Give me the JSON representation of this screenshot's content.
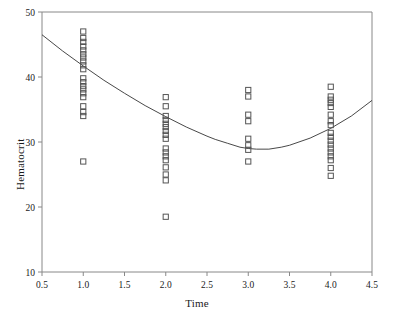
{
  "chart_data": {
    "type": "scatter",
    "title": "",
    "xlabel": "Time",
    "ylabel": "Hematocrit",
    "xlim": [
      0.5,
      4.5
    ],
    "ylim": [
      10,
      50
    ],
    "xticks": [
      "0.5",
      "1.0",
      "1.5",
      "2.0",
      "2.5",
      "3.0",
      "3.5",
      "4.0",
      "4.5"
    ],
    "xtick_values": [
      0.5,
      1.0,
      1.5,
      2.0,
      2.5,
      3.0,
      3.5,
      4.0,
      4.5
    ],
    "yticks": [
      "10",
      "20",
      "30",
      "40",
      "50"
    ],
    "ytick_values": [
      10,
      20,
      30,
      40,
      50
    ],
    "grid": false,
    "legend": null,
    "marker": "open-square",
    "marker_color": "#555555",
    "curve_color": "#333333",
    "frame_color": "#888888",
    "series": [
      {
        "name": "Hematocrit observations",
        "type": "scatter",
        "points": [
          [
            1.0,
            47.0
          ],
          [
            1.0,
            46.0
          ],
          [
            1.0,
            45.4
          ],
          [
            1.0,
            44.7
          ],
          [
            1.0,
            44.1
          ],
          [
            1.0,
            43.5
          ],
          [
            1.0,
            43.0
          ],
          [
            1.0,
            42.4
          ],
          [
            1.0,
            41.8
          ],
          [
            1.0,
            41.2
          ],
          [
            1.0,
            39.8
          ],
          [
            1.0,
            39.2
          ],
          [
            1.0,
            38.6
          ],
          [
            1.0,
            38.1
          ],
          [
            1.0,
            37.5
          ],
          [
            1.0,
            36.9
          ],
          [
            1.0,
            35.5
          ],
          [
            1.0,
            34.6
          ],
          [
            1.0,
            34.0
          ],
          [
            1.0,
            27.0
          ],
          [
            2.0,
            36.9
          ],
          [
            2.0,
            35.5
          ],
          [
            2.0,
            34.0
          ],
          [
            2.0,
            33.4
          ],
          [
            2.0,
            32.8
          ],
          [
            2.0,
            32.3
          ],
          [
            2.0,
            31.7
          ],
          [
            2.0,
            31.1
          ],
          [
            2.0,
            30.5
          ],
          [
            2.0,
            29.0
          ],
          [
            2.0,
            28.4
          ],
          [
            2.0,
            27.8
          ],
          [
            2.0,
            27.2
          ],
          [
            2.0,
            26.1
          ],
          [
            2.0,
            25.0
          ],
          [
            2.0,
            24.1
          ],
          [
            2.0,
            18.5
          ],
          [
            3.0,
            38.0
          ],
          [
            3.0,
            37.0
          ],
          [
            3.0,
            34.2
          ],
          [
            3.0,
            33.2
          ],
          [
            3.0,
            30.5
          ],
          [
            3.0,
            29.5
          ],
          [
            3.0,
            28.8
          ],
          [
            3.0,
            27.0
          ],
          [
            4.0,
            38.5
          ],
          [
            4.0,
            37.0
          ],
          [
            4.0,
            36.5
          ],
          [
            4.0,
            36.0
          ],
          [
            4.0,
            35.4
          ],
          [
            4.0,
            34.2
          ],
          [
            4.0,
            33.2
          ],
          [
            4.0,
            32.6
          ],
          [
            4.0,
            31.4
          ],
          [
            4.0,
            30.8
          ],
          [
            4.0,
            30.2
          ],
          [
            4.0,
            29.6
          ],
          [
            4.0,
            29.0
          ],
          [
            4.0,
            28.4
          ],
          [
            4.0,
            27.8
          ],
          [
            4.0,
            27.2
          ],
          [
            4.0,
            26.0
          ],
          [
            4.0,
            24.8
          ]
        ]
      },
      {
        "name": "Fitted curve",
        "type": "line",
        "points": [
          [
            0.5,
            46.5
          ],
          [
            0.75,
            44.0
          ],
          [
            1.0,
            41.7
          ],
          [
            1.25,
            39.5
          ],
          [
            1.5,
            37.5
          ],
          [
            1.75,
            35.6
          ],
          [
            2.0,
            33.9
          ],
          [
            2.25,
            32.3
          ],
          [
            2.5,
            30.9
          ],
          [
            2.6,
            30.4
          ],
          [
            2.75,
            29.8
          ],
          [
            2.9,
            29.2
          ],
          [
            3.0,
            29.0
          ],
          [
            3.1,
            28.9
          ],
          [
            3.25,
            28.9
          ],
          [
            3.4,
            29.2
          ],
          [
            3.5,
            29.5
          ],
          [
            3.75,
            30.6
          ],
          [
            4.0,
            32.1
          ],
          [
            4.25,
            34.0
          ],
          [
            4.5,
            36.4
          ]
        ]
      }
    ]
  },
  "axis": {
    "x_title": "Time",
    "y_title": "Hematocrit"
  }
}
